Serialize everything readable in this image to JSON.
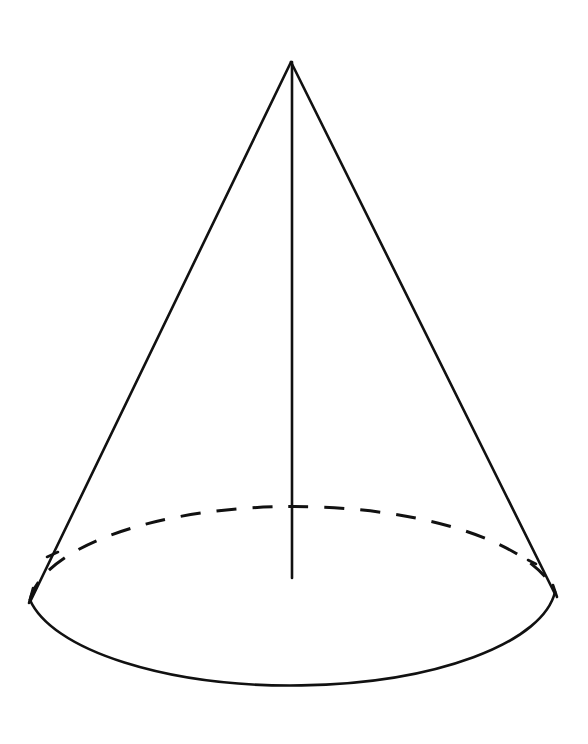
{
  "figure": {
    "type": "cone",
    "stroke_color": "#111111",
    "background_color": "#ffffff",
    "apex": {
      "x": 291,
      "y": 62
    },
    "axis_end": {
      "x": 292,
      "y": 578
    },
    "base_ellipse": {
      "cx": 292,
      "cy": 605,
      "rx": 265,
      "ry": 103
    },
    "left_tangent": {
      "x": 30,
      "y": 600
    },
    "right_tangent": {
      "x": 555,
      "y": 592
    }
  }
}
